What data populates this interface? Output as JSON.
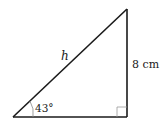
{
  "diagram": {
    "type": "right-triangle",
    "vertices": {
      "bottom_left": [
        13,
        117
      ],
      "bottom_right": [
        127,
        117
      ],
      "top_right": [
        127,
        9
      ]
    },
    "hypotenuse_label": "h",
    "vertical_side_label": "8 cm",
    "angle_label": "43°",
    "right_angle_marker": true,
    "colors": {
      "stroke": "#1a1a1a",
      "angle_arc": "#888888",
      "right_angle_box": "#999999",
      "background": "#ffffff"
    }
  }
}
